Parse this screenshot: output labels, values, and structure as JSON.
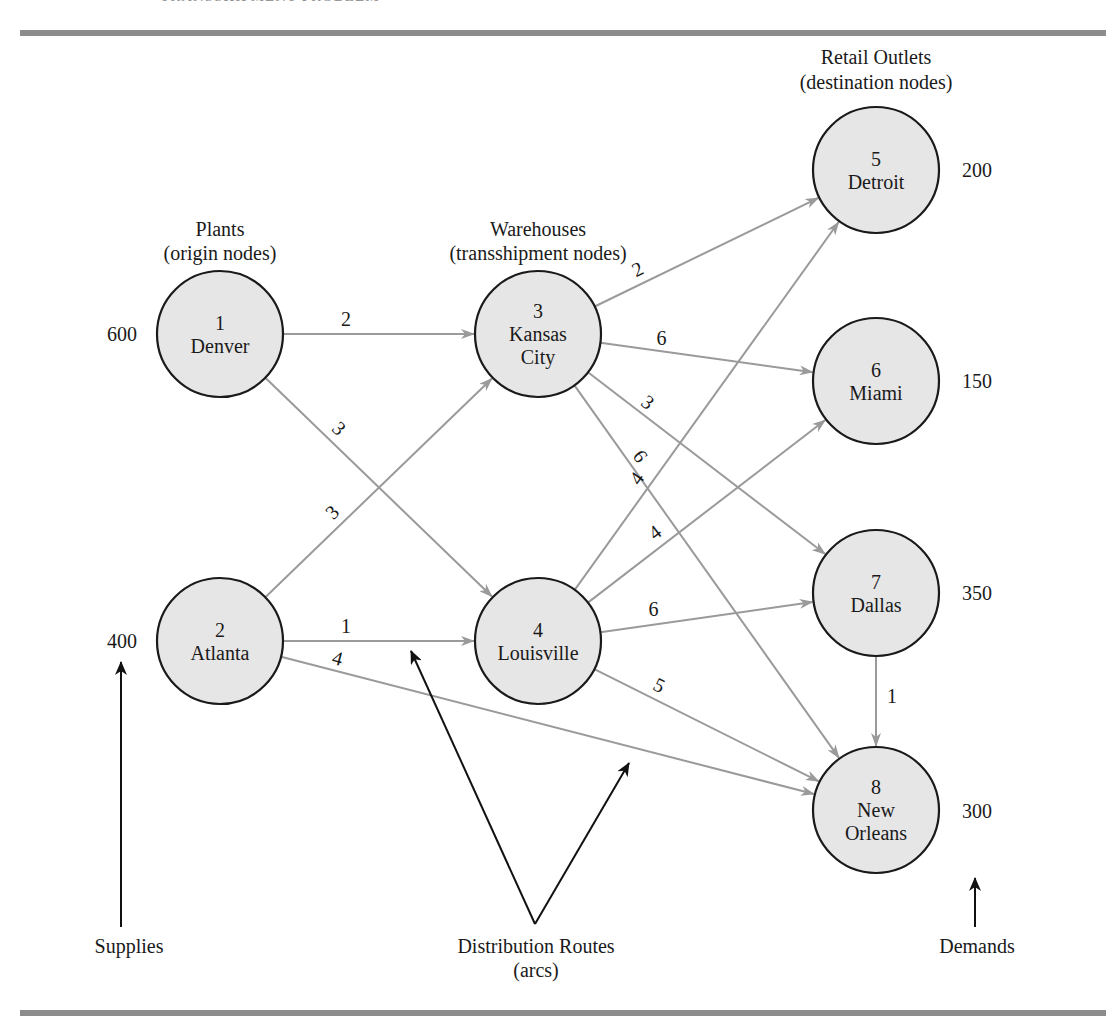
{
  "header": {
    "partial_title": "TRANSSHIPMENT PROBLEM"
  },
  "group_labels": {
    "plants": [
      "Plants",
      "(origin nodes)"
    ],
    "warehouses": [
      "Warehouses",
      "(transshipment nodes)"
    ],
    "retail": [
      "Retail Outlets",
      "(destination nodes)"
    ]
  },
  "annotations": {
    "supplies": "Supplies",
    "routes": [
      "Distribution Routes",
      "(arcs)"
    ],
    "demands": "Demands"
  },
  "colors": {
    "node_fill": "#e6e6e6",
    "node_stroke": "#1a1a1a",
    "arc": "#9a9a9a",
    "annotation": "#111111",
    "rule": "#8c8c8c"
  },
  "nodes": [
    {
      "id": 1,
      "name": [
        "Denver"
      ],
      "role": "origin",
      "supply": 600
    },
    {
      "id": 2,
      "name": [
        "Atlanta"
      ],
      "role": "origin",
      "supply": 400
    },
    {
      "id": 3,
      "name": [
        "Kansas",
        "City"
      ],
      "role": "transshipment"
    },
    {
      "id": 4,
      "name": [
        "Louisville"
      ],
      "role": "transshipment"
    },
    {
      "id": 5,
      "name": [
        "Detroit"
      ],
      "role": "destination",
      "demand": 200
    },
    {
      "id": 6,
      "name": [
        "Miami"
      ],
      "role": "destination",
      "demand": 150
    },
    {
      "id": 7,
      "name": [
        "Dallas"
      ],
      "role": "destination",
      "demand": 350
    },
    {
      "id": 8,
      "name": [
        "New",
        "Orleans"
      ],
      "role": "destination",
      "demand": 300
    }
  ],
  "arcs": [
    {
      "from": 1,
      "to": 3,
      "cost": 2
    },
    {
      "from": 1,
      "to": 4,
      "cost": 3
    },
    {
      "from": 2,
      "to": 3,
      "cost": 3
    },
    {
      "from": 2,
      "to": 4,
      "cost": 1
    },
    {
      "from": 2,
      "to": 8,
      "cost": 4
    },
    {
      "from": 3,
      "to": 5,
      "cost": 2
    },
    {
      "from": 3,
      "to": 6,
      "cost": 6
    },
    {
      "from": 3,
      "to": 7,
      "cost": 3
    },
    {
      "from": 3,
      "to": 8,
      "cost": 6
    },
    {
      "from": 4,
      "to": 5,
      "cost": 4
    },
    {
      "from": 4,
      "to": 6,
      "cost": 4
    },
    {
      "from": 4,
      "to": 7,
      "cost": 6
    },
    {
      "from": 4,
      "to": 8,
      "cost": 5
    },
    {
      "from": 7,
      "to": 8,
      "cost": 1
    }
  ]
}
